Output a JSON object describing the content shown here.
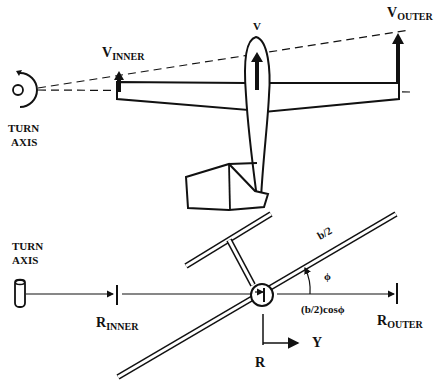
{
  "top_view": {
    "turn_axis_label_line1": "TURN",
    "turn_axis_label_line2": "AXIS",
    "v_inner": {
      "main": "V",
      "sub": "INNER"
    },
    "v_center": "V",
    "v_outer": {
      "main": "V",
      "sub": "OUTER"
    }
  },
  "front_view": {
    "turn_axis_label_line1": "TURN",
    "turn_axis_label_line2": "AXIS",
    "r_inner": {
      "main": "R",
      "sub": "INNER"
    },
    "r_outer": {
      "main": "R",
      "sub": "OUTER"
    },
    "half_span": "b/2",
    "bank_angle": "ϕ",
    "projected_half_span": "(b/2)cosϕ",
    "axis_r": "R",
    "axis_y": "Y"
  },
  "colors": {
    "ink": "#111111",
    "background": "#ffffff"
  }
}
